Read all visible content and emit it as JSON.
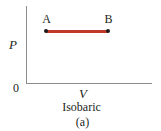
{
  "figure": {
    "panel_label": "(a)",
    "process_caption": "Isobaric",
    "background_color": "#ffffff",
    "axis_color": "#8d8d8d",
    "curve_color": "#c0392b",
    "point_color": "#1a1a1a",
    "text_color": "#231f20"
  },
  "axes": {
    "y_label": "P",
    "x_label": "V",
    "origin_label": "0",
    "y_axis_name": "pressure-axis",
    "x_axis_name": "volume-axis"
  },
  "points": [
    {
      "label": "A",
      "role": "start-state"
    },
    {
      "label": "B",
      "role": "end-state"
    }
  ],
  "chart_data": {
    "type": "line",
    "title": "Isobaric",
    "subtitle": "(a)",
    "xlabel": "V",
    "ylabel": "P",
    "grid": false,
    "legend": "none",
    "axis_ticks": {
      "x": [],
      "y": [],
      "origin": "0"
    },
    "annotations": [
      {
        "text": "A",
        "x": 0.16,
        "y": 0.68,
        "position": "above-left-endpoint"
      },
      {
        "text": "B",
        "x": 0.65,
        "y": 0.68,
        "position": "above-right-endpoint"
      }
    ],
    "series": [
      {
        "name": "isobaric process A to B",
        "color": "#c0392b",
        "marker": "filled-circle",
        "x": [
          0.16,
          0.65
        ],
        "y": [
          0.68,
          0.68
        ]
      }
    ],
    "xlim": [
      0,
      1
    ],
    "ylim": [
      0,
      1
    ]
  }
}
